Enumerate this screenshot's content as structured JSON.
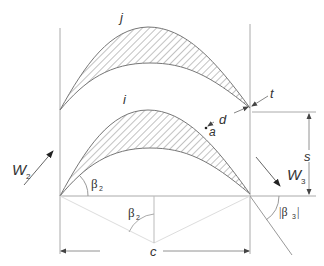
{
  "diagram": {
    "type": "turbine blade cascade geometry",
    "labels": {
      "blade_upper": "j",
      "blade_lower": "i",
      "trailing_edge_thickness": "t",
      "throat": "d",
      "throat_point": "a",
      "pitch": "s",
      "chord": "c",
      "inlet_velocity": "W",
      "inlet_velocity_sub": "2",
      "exit_velocity": "W",
      "exit_velocity_sub": "3",
      "inlet_angle": "β",
      "inlet_angle_sub": "2",
      "stagger_angle": "β",
      "stagger_angle_sub": "2",
      "exit_angle": "|β",
      "exit_angle_sub": "3",
      "exit_angle_close": "|"
    },
    "colors": {
      "line": "#9a9a9a",
      "blade_outline": "#777777",
      "hatch": "#777777",
      "text": "#333333",
      "guide": "#cccccc"
    }
  }
}
